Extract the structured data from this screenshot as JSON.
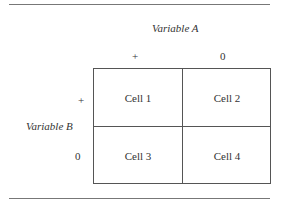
{
  "variable_a": {
    "label": "Variable A",
    "levels": [
      "+",
      "0"
    ]
  },
  "variable_b": {
    "label": "Variable B",
    "levels": [
      "+",
      "0"
    ]
  },
  "cells": [
    "Cell 1",
    "Cell 2",
    "Cell 3",
    "Cell 4"
  ]
}
